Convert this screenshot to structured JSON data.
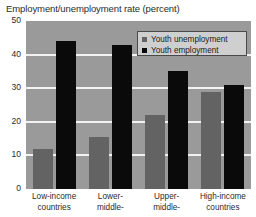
{
  "chart_data": {
    "type": "bar",
    "title": "Employment/unemployment rate (percent)",
    "xlabel": "",
    "ylabel": "",
    "ylim": [
      0,
      50
    ],
    "yticks": [
      "0",
      "10",
      "20",
      "30",
      "40",
      "50"
    ],
    "grid": true,
    "legend_position": "top-right",
    "categories": [
      "Low-income countries",
      "Lower-middle-",
      "Upper-middle-",
      "High-income countries"
    ],
    "category_lines": [
      [
        "Low-income",
        "countries"
      ],
      [
        "Lower-",
        "middle-"
      ],
      [
        "Upper-",
        "middle-"
      ],
      [
        "High-income",
        "countries"
      ]
    ],
    "series": [
      {
        "name": "Youth unemployment",
        "color": "#636363",
        "values": [
          12,
          15.5,
          22,
          28.8
        ]
      },
      {
        "name": "Youth employment",
        "color": "#0a0a0a",
        "values": [
          44,
          43,
          35,
          31
        ]
      }
    ]
  },
  "colors": {
    "plot_background": "#9a9a9a",
    "gridline": "#f2f2f2",
    "page_background": "#ffffff",
    "legend_background": "#cfcfcf",
    "legend_border": "#4a4a4a"
  }
}
